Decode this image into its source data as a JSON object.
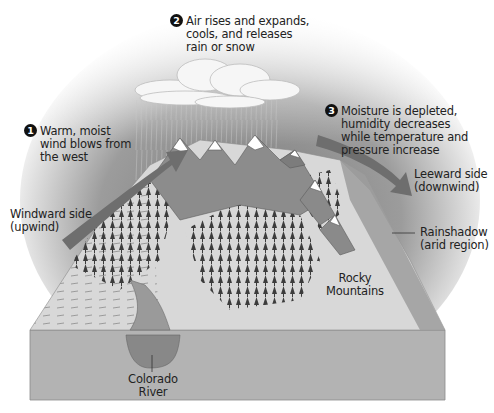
{
  "steps": [
    {
      "number": "1",
      "lines": [
        "Warm, moist",
        "wind blows from",
        "the west"
      ]
    },
    {
      "number": "2",
      "lines": [
        "Air rises and expands,",
        "cools, and releases",
        "rain or snow"
      ]
    },
    {
      "number": "3",
      "lines": [
        "Moisture is depleted,",
        "humidity decreases",
        "while temperature and",
        "pressure increase"
      ]
    }
  ],
  "labels": {
    "windward": [
      "Windward side",
      "(upwind)"
    ],
    "leeward": [
      "Leeward side",
      "(downwind)"
    ],
    "rainshadow": [
      "Rainshadow",
      "(arid region)"
    ],
    "mountains": [
      "Rocky",
      "Mountains"
    ],
    "river": [
      "Colorado",
      "River"
    ]
  },
  "colors": {
    "sky_dark": "#8a8a8a",
    "block_face": "#b3b3b3",
    "block_top": "#d9d9d9",
    "arrow": "#6e6e6e",
    "river": "#8f8f8f",
    "rainshadow": "#9a9a9a"
  }
}
